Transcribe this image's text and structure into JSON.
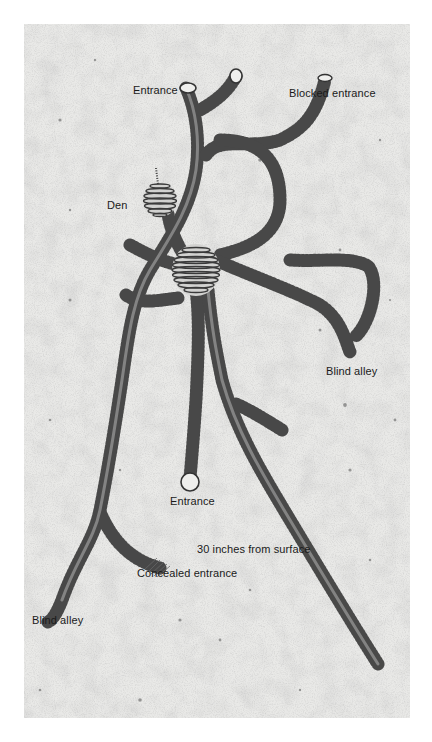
{
  "figure": {
    "labels": [
      {
        "id": "entrance-top",
        "text": "Entrance",
        "x": 133,
        "y": 84
      },
      {
        "id": "blocked-entrance",
        "text": "Blocked entrance",
        "x": 289,
        "y": 87
      },
      {
        "id": "den",
        "text": "Den",
        "x": 107,
        "y": 199
      },
      {
        "id": "blind-alley-right",
        "text": "Blind alley",
        "x": 326,
        "y": 365
      },
      {
        "id": "entrance-bottom",
        "text": "Entrance",
        "x": 170,
        "y": 495
      },
      {
        "id": "depth-note",
        "text": "30 inches from surface",
        "x": 197,
        "y": 543
      },
      {
        "id": "concealed-entrance",
        "text": "Concealed entrance",
        "x": 137,
        "y": 567
      },
      {
        "id": "blind-alley-left",
        "text": "Blind alley",
        "x": 32,
        "y": 614
      }
    ],
    "colors": {
      "background": "#ffffff",
      "soil": "#e7e7e5",
      "tunnel_ring": "#3a3a3a",
      "tunnel_fill": "#d8d8d6",
      "label_text": "#1a1a1a"
    }
  }
}
